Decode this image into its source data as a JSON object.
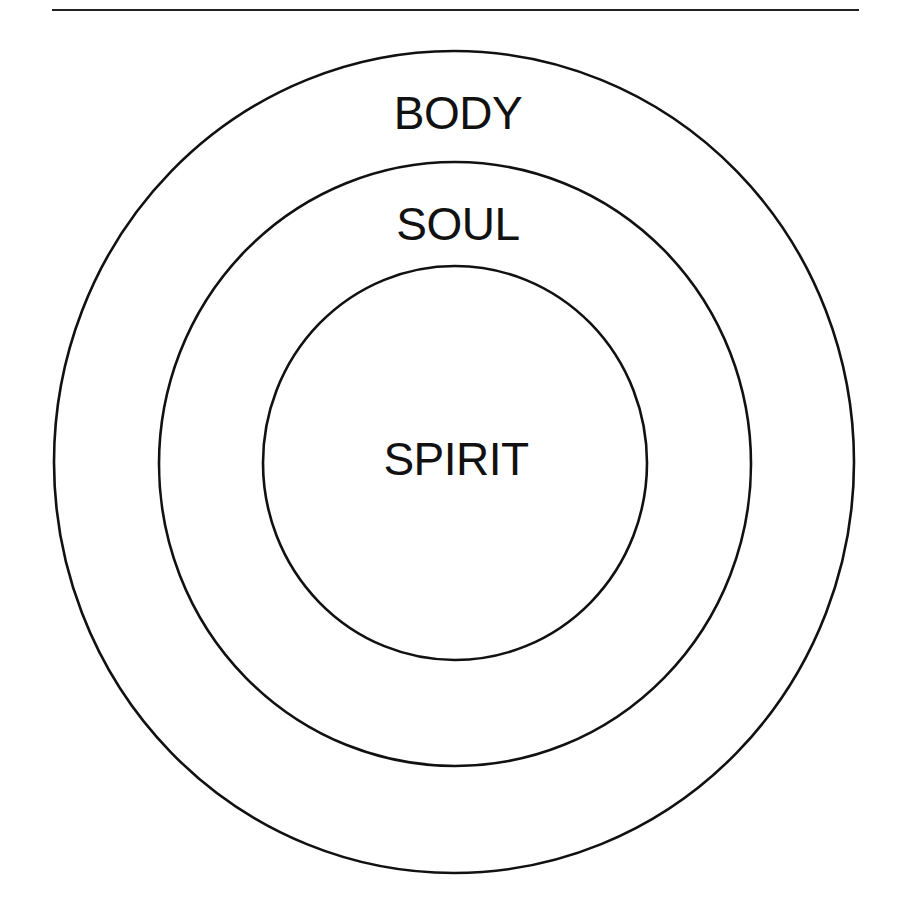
{
  "diagram": {
    "type": "concentric-circles",
    "stroke_color": "#111111",
    "background_color": "#ffffff",
    "top_rule": {
      "x1": 52,
      "y1": 10,
      "x2": 859,
      "y2": 10
    },
    "rings": [
      {
        "name": "body",
        "label": "BODY",
        "cx": 454,
        "cy": 462,
        "rx": 400,
        "ry": 411
      },
      {
        "name": "soul",
        "label": "SOUL",
        "cx": 455,
        "cy": 464,
        "rx": 296,
        "ry": 302
      },
      {
        "name": "spirit",
        "label": "SPIRIT",
        "cx": 455,
        "cy": 463,
        "rx": 192,
        "ry": 197
      }
    ]
  },
  "labels": {
    "body": "BODY",
    "soul": "SOUL",
    "spirit": "SPIRIT"
  }
}
